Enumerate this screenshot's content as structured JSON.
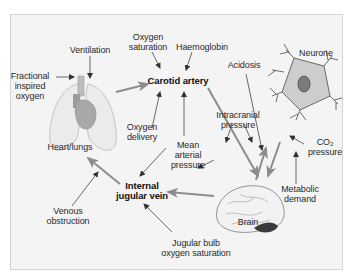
{
  "diagram": {
    "nodes": {
      "ventilation": {
        "l1": "Ventilation"
      },
      "fractional": {
        "l1": "Fractional",
        "l2": "inspired",
        "l3": "oxygen"
      },
      "oxygen_saturation": {
        "l1": "Oxygen",
        "l2": "saturation"
      },
      "haemoglobin": {
        "l1": "Haemoglobin"
      },
      "carotid": {
        "l1": "Carotid artery"
      },
      "neurone": {
        "l1": "Neurone"
      },
      "acidosis": {
        "l1": "Acidosis"
      },
      "heart_lungs": {
        "l1": "Heart/lungs"
      },
      "oxygen_delivery": {
        "l1": "Oxygen",
        "l2": "delivery"
      },
      "intracranial": {
        "l1": "Intracranial",
        "l2": "pressure"
      },
      "mean_arterial": {
        "l1": "Mean",
        "l2": "arterial",
        "l3": "pressure"
      },
      "co2": {
        "l1": "CO₂",
        "l2": "pressure"
      },
      "internal_jugular": {
        "l1": "Internal",
        "l2": "jugular vein"
      },
      "venous_obstruction": {
        "l1": "Venous",
        "l2": "obstruction"
      },
      "metabolic": {
        "l1": "Metabolic",
        "l2": "demand"
      },
      "brain": {
        "l1": "Brain"
      },
      "jugular_bulb": {
        "l1": "Jugular bulb",
        "l2": "oxygen saturation"
      }
    },
    "colors": {
      "background": "#f4f4f4",
      "frame_border": "#d4d4d4",
      "thin_arrow": "#444444",
      "thick_arrow": "#8c8c8c",
      "organ_fill": "#e8e8e8",
      "neurone_fill": "#c8c8c8",
      "nucleus_fill": "#7a7a7a"
    }
  }
}
